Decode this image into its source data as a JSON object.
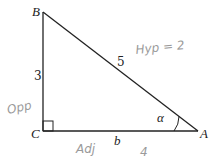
{
  "diagram": {
    "type": "right-triangle",
    "vertices": {
      "B": {
        "label": "B"
      },
      "C": {
        "label": "C"
      },
      "A": {
        "label": "A"
      }
    },
    "sides": {
      "BC": {
        "label": "3"
      },
      "BA": {
        "label": "5"
      },
      "CA": {
        "label": "b"
      }
    },
    "angle": {
      "vertex": "A",
      "label": "α"
    },
    "right_angle_at": "C",
    "colors": {
      "lines": "#222222",
      "handwriting": "#9a9a9a"
    }
  },
  "annotations": {
    "hyp": "Hyp = 2",
    "opp": "Opp",
    "adj": "Adj",
    "adj_value": "4"
  }
}
